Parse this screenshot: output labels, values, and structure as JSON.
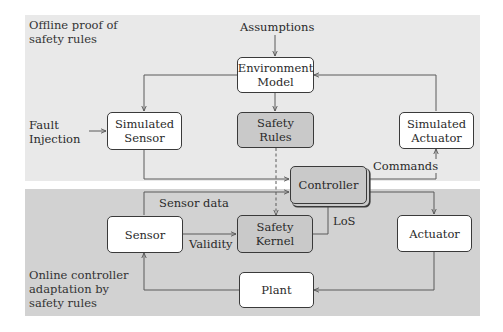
{
  "diagram": {
    "panels": {
      "offline": {
        "label_line1": "Offline proof of",
        "label_line2": "safety rules",
        "color": "#e9e9e9"
      },
      "online": {
        "label_line1": "Online controller",
        "label_line2": "adaptation by",
        "label_line3": "safety rules",
        "color": "#d2d2d2"
      }
    },
    "nodes": {
      "environment_model": {
        "line1": "Environment",
        "line2": "Model"
      },
      "simulated_sensor": {
        "line1": "Simulated",
        "line2": "Sensor"
      },
      "safety_rules": {
        "line1": "Safety",
        "line2": "Rules"
      },
      "simulated_actuator": {
        "line1": "Simulated",
        "line2": "Actuator"
      },
      "controller": {
        "label": "Controller"
      },
      "sensor": {
        "label": "Sensor"
      },
      "safety_kernel": {
        "line1": "Safety",
        "line2": "Kernel"
      },
      "actuator": {
        "label": "Actuator"
      },
      "plant": {
        "label": "Plant"
      }
    },
    "external_inputs": {
      "assumptions": "Assumptions",
      "fault_injection_line1": "Fault",
      "fault_injection_line2": "Injection"
    },
    "edge_labels": {
      "commands": "Commands",
      "sensor_data": "Sensor data",
      "validity": "Validity",
      "los": "LoS"
    },
    "edges": [
      {
        "from": "Assumptions",
        "to": "Environment Model",
        "style": "solid"
      },
      {
        "from": "Environment Model",
        "to": "Simulated Sensor",
        "style": "solid"
      },
      {
        "from": "Environment Model",
        "to": "Safety Rules",
        "style": "solid"
      },
      {
        "from": "Simulated Actuator",
        "to": "Environment Model",
        "style": "solid"
      },
      {
        "from": "Fault Injection",
        "to": "Simulated Sensor",
        "style": "solid"
      },
      {
        "from": "Simulated Sensor",
        "to": "Controller",
        "style": "solid"
      },
      {
        "from": "Controller",
        "to": "Simulated Actuator",
        "label": "Commands",
        "style": "solid"
      },
      {
        "from": "Safety Rules",
        "to": "Safety Kernel",
        "style": "dashed"
      },
      {
        "from": "Sensor",
        "to": "Controller",
        "label": "Sensor data",
        "style": "solid"
      },
      {
        "from": "Sensor",
        "to": "Safety Kernel",
        "label": "Validity",
        "style": "solid"
      },
      {
        "from": "Safety Kernel",
        "to": "Controller",
        "label": "LoS",
        "style": "solid"
      },
      {
        "from": "Controller",
        "to": "Actuator",
        "style": "solid"
      },
      {
        "from": "Actuator",
        "to": "Plant",
        "style": "solid"
      },
      {
        "from": "Plant",
        "to": "Sensor",
        "style": "solid"
      }
    ]
  }
}
